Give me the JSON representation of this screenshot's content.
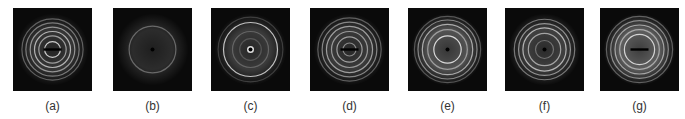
{
  "figure": {
    "panels": [
      {
        "label": "(a)",
        "rings": [
          {
            "r": 0.22,
            "b": 0.85
          },
          {
            "r": 0.38,
            "b": 0.6
          },
          {
            "r": 0.5,
            "b": 0.7
          },
          {
            "r": 0.62,
            "b": 0.55
          },
          {
            "r": 0.74,
            "b": 0.45
          },
          {
            "r": 0.85,
            "b": 0.35
          }
        ],
        "glow": 0.18,
        "center": "bar"
      },
      {
        "label": "(b)",
        "rings": [
          {
            "r": 0.65,
            "b": 0.35
          }
        ],
        "glow": 0.14,
        "center": "dot"
      },
      {
        "label": "(c)",
        "rings": [
          {
            "r": 0.75,
            "b": 0.8
          },
          {
            "r": 0.5,
            "b": 0.25
          },
          {
            "r": 0.3,
            "b": 0.2
          },
          {
            "r": 0.9,
            "b": 0.2
          }
        ],
        "glow": 0.2,
        "center": "ringdot"
      },
      {
        "label": "(d)",
        "rings": [
          {
            "r": 0.18,
            "b": 0.5
          },
          {
            "r": 0.35,
            "b": 0.6
          },
          {
            "r": 0.5,
            "b": 0.55
          },
          {
            "r": 0.64,
            "b": 0.6
          },
          {
            "r": 0.76,
            "b": 0.5
          },
          {
            "r": 0.88,
            "b": 0.35
          }
        ],
        "glow": 0.2,
        "center": "bar"
      },
      {
        "label": "(e)",
        "rings": [
          {
            "r": 0.38,
            "b": 0.9
          },
          {
            "r": 0.55,
            "b": 0.5
          },
          {
            "r": 0.7,
            "b": 0.65
          },
          {
            "r": 0.82,
            "b": 0.5
          },
          {
            "r": 0.92,
            "b": 0.3
          }
        ],
        "glow": 0.3,
        "center": "dot"
      },
      {
        "label": "(f)",
        "rings": [
          {
            "r": 0.25,
            "b": 0.35
          },
          {
            "r": 0.45,
            "b": 0.6
          },
          {
            "r": 0.6,
            "b": 0.7
          },
          {
            "r": 0.72,
            "b": 0.55
          },
          {
            "r": 0.84,
            "b": 0.45
          }
        ],
        "glow": 0.22,
        "center": "dot"
      },
      {
        "label": "(g)",
        "rings": [
          {
            "r": 0.42,
            "b": 0.85
          },
          {
            "r": 0.55,
            "b": 0.55
          },
          {
            "r": 0.68,
            "b": 0.6
          },
          {
            "r": 0.8,
            "b": 0.5
          },
          {
            "r": 0.92,
            "b": 0.35
          }
        ],
        "glow": 0.35,
        "center": "bar"
      }
    ]
  }
}
